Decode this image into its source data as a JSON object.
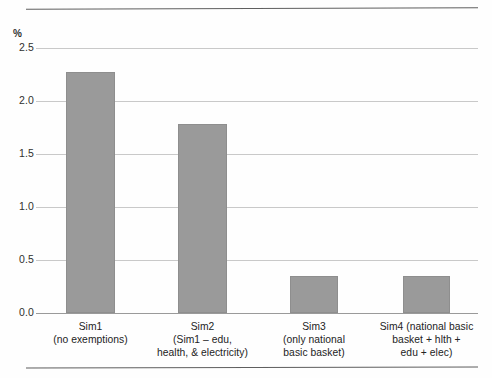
{
  "figure": {
    "axis_unit_label": "%",
    "top_rule": "horizontal-rule",
    "bottom_rule": "horizontal-rule"
  },
  "chart_data": {
    "type": "bar",
    "title": "",
    "subtitle": "",
    "xlabel": "",
    "ylabel": "%",
    "ylim": [
      0.0,
      2.5
    ],
    "ytick_labels": [
      "2.5",
      "2.0",
      "1.5",
      "1.0",
      "0.5",
      "0.0"
    ],
    "ytick_values": [
      2.5,
      2.0,
      1.5,
      1.0,
      0.5,
      0.0
    ],
    "grid": true,
    "grid_axis": "y",
    "legend": false,
    "legend_position": "none",
    "bar_color": "#9a9a9a",
    "categories": [
      "Sim1 (no exemptions)",
      "Sim2 (Sim1 – edu, health, & electricity)",
      "Sim3 (only national basic basket)",
      "Sim4 (national basic basket + hlth + edu + elec)"
    ],
    "category_lines": [
      [
        "Sim1",
        "(no exemptions)"
      ],
      [
        "Sim2",
        "(Sim1 – edu,",
        "health, & electricity)"
      ],
      [
        "Sim3",
        "(only national",
        "basic basket)"
      ],
      [
        "Sim4 (national basic",
        "basket + hlth +",
        "edu + elec)"
      ]
    ],
    "values": [
      2.27,
      1.78,
      0.35,
      0.35
    ]
  }
}
